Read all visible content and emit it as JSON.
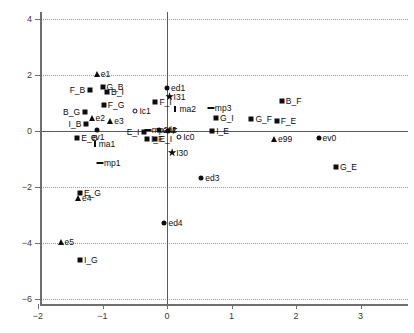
{
  "chart_data": {
    "type": "scatter",
    "title": "",
    "xlabel": "",
    "ylabel": "",
    "xlim": [
      -2.25,
      3.55
    ],
    "ylim": [
      -6.6,
      4.5
    ],
    "grid": true,
    "legend": "none",
    "xticks": [
      -2,
      -1,
      0,
      1,
      2,
      3
    ],
    "xticklabels": [
      "−2",
      "−1",
      "0",
      "1",
      "2",
      "3"
    ],
    "yticks": [
      4,
      2,
      0,
      -2,
      -4,
      -6
    ],
    "yticklabels": [
      "4",
      "2",
      "0",
      "−2",
      "−4",
      "−6"
    ],
    "marker_kinds": {
      "square": "filled-square",
      "circle": "filled-circle",
      "opencircle": "open-circle",
      "triangle": "filled-triangle-up",
      "star": "filled-star",
      "vbar": "vertical-tick",
      "hbar": "horizontal-dash"
    },
    "points": [
      {
        "label": "e1",
        "x": -1.09,
        "y": 2.02,
        "marker": "triangle",
        "lpos": "right"
      },
      {
        "label": "G_B",
        "x": -1.0,
        "y": 1.56,
        "marker": "square",
        "lpos": "right"
      },
      {
        "label": "B_I",
        "x": -0.93,
        "y": 1.4,
        "marker": "square",
        "lpos": "right"
      },
      {
        "label": "F_B",
        "x": -1.19,
        "y": 1.45,
        "marker": "square",
        "lpos": "left"
      },
      {
        "label": "ed1",
        "x": 0.0,
        "y": 1.55,
        "marker": "circle",
        "lpos": "right"
      },
      {
        "label": "I31",
        "x": 0.04,
        "y": 1.23,
        "marker": "star",
        "lpos": "right"
      },
      {
        "label": "F_I",
        "x": -0.18,
        "y": 1.04,
        "marker": "square",
        "lpos": "right"
      },
      {
        "label": "F_G",
        "x": -0.98,
        "y": 0.94,
        "marker": "square",
        "lpos": "right"
      },
      {
        "label": "ma2",
        "x": 0.13,
        "y": 0.77,
        "marker": "vbar",
        "lpos": "right"
      },
      {
        "label": "mp3",
        "x": 0.68,
        "y": 0.82,
        "marker": "hbar",
        "lpos": "right"
      },
      {
        "label": "B_F",
        "x": 1.78,
        "y": 1.07,
        "marker": "square",
        "lpos": "right"
      },
      {
        "label": "B_G",
        "x": -1.27,
        "y": 0.69,
        "marker": "square",
        "lpos": "left"
      },
      {
        "label": "Ic1",
        "x": -0.49,
        "y": 0.72,
        "marker": "opencircle",
        "lpos": "right"
      },
      {
        "label": "G_I",
        "x": 0.76,
        "y": 0.48,
        "marker": "square",
        "lpos": "right"
      },
      {
        "label": "G_F",
        "x": 1.31,
        "y": 0.44,
        "marker": "square",
        "lpos": "right"
      },
      {
        "label": "F_E",
        "x": 1.7,
        "y": 0.35,
        "marker": "square",
        "lpos": "right"
      },
      {
        "label": "e2",
        "x": -1.17,
        "y": 0.48,
        "marker": "triangle",
        "lpos": "right"
      },
      {
        "label": "e3",
        "x": -0.88,
        "y": 0.35,
        "marker": "triangle",
        "lpos": "right"
      },
      {
        "label": "I_B",
        "x": -1.25,
        "y": 0.26,
        "marker": "square",
        "lpos": "left"
      },
      {
        "label": "mp2M",
        "x": -0.3,
        "y": 0.05,
        "marker": "hbar",
        "lpos": "right"
      },
      {
        "label": "ed2",
        "x": -0.13,
        "y": 0.05,
        "marker": "circle",
        "lpos": "right"
      },
      {
        "label": "F",
        "x": 0.02,
        "y": 0.01,
        "marker": "circle",
        "lpos": "right"
      },
      {
        "label": "ev1",
        "x": -1.09,
        "y": 0.05,
        "marker": "circle",
        "lpos": "below"
      },
      {
        "label": "E_I",
        "x": -0.35,
        "y": -0.04,
        "marker": "square",
        "lpos": "left"
      },
      {
        "label": "I_E",
        "x": 0.7,
        "y": 0.0,
        "marker": "square",
        "lpos": "right"
      },
      {
        "label": "E_B",
        "x": -1.39,
        "y": -0.25,
        "marker": "square",
        "lpos": "right"
      },
      {
        "label": "I_F",
        "x": -0.31,
        "y": -0.3,
        "marker": "square",
        "lpos": "right"
      },
      {
        "label": "E_I ",
        "x": -0.18,
        "y": -0.3,
        "marker": "square",
        "lpos": "right"
      },
      {
        "label": "Ic0",
        "x": 0.19,
        "y": -0.2,
        "marker": "opencircle",
        "lpos": "right"
      },
      {
        "label": "e99",
        "x": 1.66,
        "y": -0.27,
        "marker": "triangle",
        "lpos": "right"
      },
      {
        "label": "ev0",
        "x": 2.35,
        "y": -0.24,
        "marker": "circle",
        "lpos": "right"
      },
      {
        "label": "ma1",
        "x": -1.12,
        "y": -0.45,
        "marker": "vbar",
        "lpos": "right"
      },
      {
        "label": "I30",
        "x": 0.08,
        "y": -0.77,
        "marker": "star",
        "lpos": "right"
      },
      {
        "label": "mp1",
        "x": -1.04,
        "y": -1.15,
        "marker": "hbar",
        "lpos": "right"
      },
      {
        "label": "G_E",
        "x": 2.62,
        "y": -1.27,
        "marker": "square",
        "lpos": "right"
      },
      {
        "label": "ed3",
        "x": 0.53,
        "y": -1.68,
        "marker": "circle",
        "lpos": "right"
      },
      {
        "label": "E_G",
        "x": -1.35,
        "y": -2.22,
        "marker": "square",
        "lpos": "right"
      },
      {
        "label": "e4",
        "x": -1.38,
        "y": -2.4,
        "marker": "triangle",
        "lpos": "right"
      },
      {
        "label": "ed4",
        "x": -0.04,
        "y": -3.3,
        "marker": "circle",
        "lpos": "right"
      },
      {
        "label": "e5",
        "x": -1.65,
        "y": -3.95,
        "marker": "triangle",
        "lpos": "right"
      },
      {
        "label": "I_G",
        "x": -1.35,
        "y": -4.59,
        "marker": "square",
        "lpos": "right"
      }
    ]
  }
}
